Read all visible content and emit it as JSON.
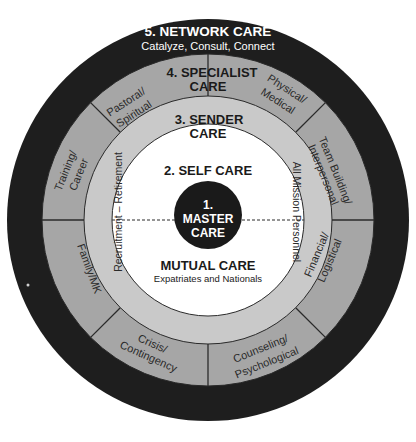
{
  "diagram": {
    "type": "concentric-rings",
    "center": {
      "x": 208,
      "y": 220
    },
    "colors": {
      "network_ring": "#1e1e1e",
      "specialist_ring": "#a6a6a6",
      "sender_ring": "#c9c9c9",
      "self_circle": "#ffffff",
      "master_circle": "#1a1a1a",
      "light_text": "#ffffff",
      "dark_text": "#1a1a1a",
      "divider": "#2a2a2a"
    },
    "network_care": {
      "title": "5. NETWORK CARE",
      "subtitle": "Catalyze, Consult, Connect"
    },
    "specialist_care": {
      "title_line1": "4. SPECIALIST",
      "title_line2": "CARE",
      "segments": [
        {
          "line1": "Pastoral/",
          "line2": "Spiritual"
        },
        {
          "line1": "Physical/",
          "line2": "Medical"
        },
        {
          "line1": "Team Building/",
          "line2": "Interpersonal"
        },
        {
          "line1": "Financial/",
          "line2": "Logistical"
        },
        {
          "line1": "Counseling/",
          "line2": "Psychological"
        },
        {
          "line1": "Crisis/",
          "line2": "Contingency"
        },
        {
          "line1": "Family/MK",
          "line2": ""
        },
        {
          "line1": "Training/",
          "line2": "Career"
        }
      ]
    },
    "sender_care": {
      "title_line1": "3. SENDER",
      "title_line2": "CARE",
      "left_label": "Recruitment – Retirement",
      "right_label": "All Mission Personnel"
    },
    "self_care": {
      "title": "2. SELF CARE"
    },
    "master_care": {
      "line1": "1.",
      "line2": "MASTER",
      "line3": "CARE"
    },
    "mutual_care": {
      "title": "MUTUAL CARE",
      "subtitle": "Expatriates and Nationals"
    }
  }
}
